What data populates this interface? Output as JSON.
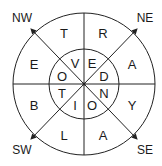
{
  "diagram": {
    "type": "letter-wheel",
    "directions": {
      "nw": "NW",
      "ne": "NE",
      "sw": "SW",
      "se": "SE"
    },
    "outer_ring": {
      "top_left": "T",
      "top_right": "R",
      "right_upper": "A",
      "right_lower": "Y",
      "bottom_right": "A",
      "bottom_left": "L",
      "left_lower": "B",
      "left_upper": "E"
    },
    "inner_ring": {
      "top_left": "V",
      "top_right": "E",
      "right_upper": "D",
      "right_lower": "N",
      "bottom_right": "O",
      "bottom_left": "I",
      "left_lower": "T",
      "left_upper": "O"
    },
    "colors": {
      "line": "#222222",
      "text": "#1a1a1a",
      "background": "#ffffff"
    }
  }
}
